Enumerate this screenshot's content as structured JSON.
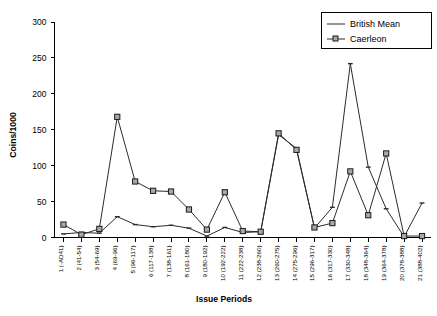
{
  "chart_data": {
    "type": "line",
    "title": "",
    "xlabel": "Issue Periods",
    "ylabel": "Coins/1000",
    "ylim": [
      0,
      300
    ],
    "yticks": [
      0,
      50,
      100,
      150,
      200,
      250,
      300
    ],
    "grid": false,
    "legend_position": "top-right",
    "categories": [
      "1 (-AD41)",
      "2 (41-54)",
      "3 (54-69)",
      "4 (69-96)",
      "5 (96-117)",
      "6 (117-138)",
      "7 (138-161)",
      "8 (161-180)",
      "9 (180-192)",
      "10 (192-222)",
      "11 (222-238)",
      "12 (238-260)",
      "13 (260-275)",
      "14 (275-296)",
      "15 (296-317)",
      "16 (317-330)",
      "17 (330-348)",
      "18 (348-364)",
      "19 (364-378)",
      "20 (378-388)",
      "21 (388-402)"
    ],
    "series": [
      {
        "name": "British Mean",
        "marker": "none",
        "color": "#2b2b2b",
        "values": [
          5,
          7,
          6,
          29,
          18,
          15,
          17,
          13,
          2,
          14,
          7,
          8,
          143,
          124,
          13,
          42,
          242,
          98,
          40,
          1,
          48
        ]
      },
      {
        "name": "Caerleon",
        "marker": "square",
        "color": "#2b2b2b",
        "values": [
          18,
          4,
          12,
          168,
          78,
          65,
          64,
          39,
          11,
          63,
          9,
          8,
          145,
          122,
          14,
          20,
          92,
          31,
          117,
          2,
          2
        ]
      }
    ]
  },
  "legend": {
    "entries": [
      {
        "label": "British Mean"
      },
      {
        "label": "Caerleon"
      }
    ]
  },
  "axes": {
    "y_title": "Coins/1000",
    "x_title": "Issue Periods"
  }
}
